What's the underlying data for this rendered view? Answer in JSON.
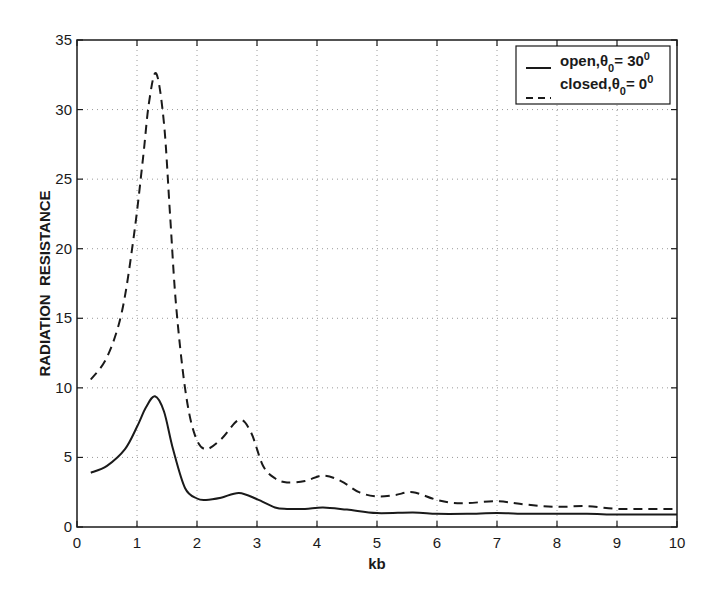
{
  "chart_data": {
    "type": "line",
    "title": "",
    "xlabel": "kb",
    "ylabel": "RADIATION  RESISTANCE",
    "xlim": [
      0,
      10
    ],
    "ylim": [
      0,
      35
    ],
    "xticks": [
      0,
      1,
      2,
      3,
      4,
      5,
      6,
      7,
      8,
      9,
      10
    ],
    "yticks": [
      0,
      5,
      10,
      15,
      20,
      25,
      30,
      35
    ],
    "grid": true,
    "legend_position": "upper right",
    "series": [
      {
        "name": "open, θ0 = 30°",
        "legend_main": "open,θ",
        "legend_sub": "0",
        "legend_rest": "= 30",
        "legend_sup": "0",
        "style": "solid",
        "color": "#1a1a1a",
        "x": [
          0.23,
          0.5,
          0.8,
          1.0,
          1.15,
          1.3,
          1.45,
          1.6,
          1.8,
          2.0,
          2.15,
          2.4,
          2.7,
          3.0,
          3.3,
          3.5,
          3.8,
          4.1,
          4.5,
          5.0,
          5.6,
          6.0,
          6.5,
          7.0,
          7.5,
          8.0,
          8.5,
          9.0,
          9.5,
          10.0
        ],
        "y": [
          3.9,
          4.4,
          5.6,
          7.2,
          8.6,
          9.4,
          8.3,
          5.6,
          2.8,
          2.05,
          1.95,
          2.1,
          2.45,
          2.0,
          1.4,
          1.3,
          1.3,
          1.4,
          1.25,
          1.0,
          1.05,
          0.95,
          0.95,
          1.0,
          0.95,
          0.95,
          0.95,
          0.9,
          0.9,
          0.9
        ]
      },
      {
        "name": "closed, θ0 = 0°",
        "legend_main": "closed,θ",
        "legend_sub": "0",
        "legend_rest": "= 0",
        "legend_sup": "0",
        "style": "dashed",
        "color": "#1a1a1a",
        "x": [
          0.23,
          0.5,
          0.75,
          0.95,
          1.1,
          1.2,
          1.32,
          1.45,
          1.55,
          1.65,
          1.8,
          1.95,
          2.13,
          2.4,
          2.7,
          2.9,
          3.1,
          3.3,
          3.5,
          3.8,
          4.1,
          4.4,
          4.7,
          5.0,
          5.3,
          5.6,
          6.0,
          6.4,
          7.0,
          7.5,
          8.0,
          8.5,
          9.0,
          9.5,
          10.0
        ],
        "y": [
          10.6,
          12.2,
          15.5,
          21.0,
          26.5,
          30.5,
          32.6,
          29.0,
          22.5,
          16.0,
          10.0,
          6.8,
          5.6,
          6.3,
          7.7,
          6.8,
          4.4,
          3.5,
          3.2,
          3.3,
          3.7,
          3.3,
          2.5,
          2.2,
          2.3,
          2.5,
          1.95,
          1.7,
          1.85,
          1.6,
          1.45,
          1.5,
          1.3,
          1.3,
          1.3
        ]
      }
    ]
  },
  "plot_area": {
    "left": 77,
    "top": 40,
    "right": 677,
    "bottom": 527
  }
}
